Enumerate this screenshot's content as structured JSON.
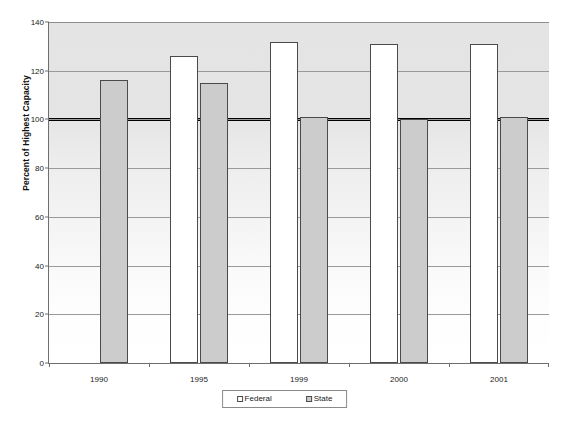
{
  "chart_data": {
    "type": "bar",
    "title": "",
    "subtitle": "",
    "xlabel": "",
    "ylabel": "Percent of Highest Capacity",
    "categories": [
      "1990",
      "1995",
      "1999",
      "2000",
      "2001"
    ],
    "series": [
      {
        "name": "Federal",
        "color": "#ffffff",
        "values": [
          null,
          126,
          132,
          131,
          131
        ]
      },
      {
        "name": "State",
        "color": "#cccccc",
        "values": [
          116,
          115,
          101,
          100,
          101
        ]
      }
    ],
    "ylim": [
      0,
      140
    ],
    "yticks": [
      0,
      20,
      40,
      60,
      80,
      100,
      120,
      140
    ],
    "ytick_labels": [
      "0",
      "20",
      "40",
      "60",
      "80",
      "100",
      "120",
      "140"
    ],
    "grid": true,
    "grid_axis": "y",
    "legend_position": "bottom",
    "annotations": [
      {
        "type": "reference-line",
        "orientation": "horizontal",
        "value": 100,
        "label": "",
        "color": "#000000",
        "linewidth": 3
      }
    ]
  },
  "legend": {
    "items": [
      {
        "label": "Federal",
        "marker": "white-square-marker"
      },
      {
        "label": "State",
        "marker": "gray-square-marker"
      }
    ]
  },
  "axis": {
    "y_title": "Percent of Highest Capacity"
  }
}
